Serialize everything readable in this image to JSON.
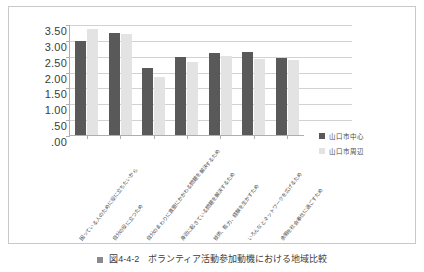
{
  "caption": {
    "marker": "square-bullet",
    "text": "図4-4-2　ボランティア活動参加動機における地域比較"
  },
  "legend": {
    "position": "right",
    "items": [
      {
        "label": "山口市中心",
        "color": "#595959"
      },
      {
        "label": "山口市周辺",
        "color": "#E3E3E3"
      }
    ]
  },
  "chart_data": {
    "type": "bar",
    "title": "",
    "subtitle": "",
    "xlabel": "",
    "ylabel": "",
    "ylim": [
      0,
      3.5
    ],
    "ytick_labels": [
      "3.50",
      "3.00",
      "2.50",
      "2.00",
      "1.50",
      "1.00",
      ".50",
      ".00"
    ],
    "ytick_values": [
      3.5,
      3.0,
      2.5,
      2.0,
      1.5,
      1.0,
      0.5,
      0.0
    ],
    "grid": true,
    "grid_axis": "y",
    "legend_position": "right",
    "categories": [
      "困っている人のために役に立ちたいから",
      "自分の役に立つため",
      "自分のまわりに直面にかかわる問題を解決するため",
      "身近に起きている問題を解決するため",
      "技術、能力、経験を生かすため",
      "いろんなとネットワークを広げるため",
      "余暇を社会奉仕に過ごすため"
    ],
    "series": [
      {
        "name": "山口市中心",
        "color": "#595959",
        "values": [
          2.97,
          3.21,
          2.12,
          2.47,
          2.59,
          2.63,
          2.42
        ]
      },
      {
        "name": "山口市周辺",
        "color": "#E3E3E3",
        "values": [
          3.33,
          3.2,
          1.82,
          2.29,
          2.5,
          2.41,
          2.35
        ]
      }
    ]
  }
}
